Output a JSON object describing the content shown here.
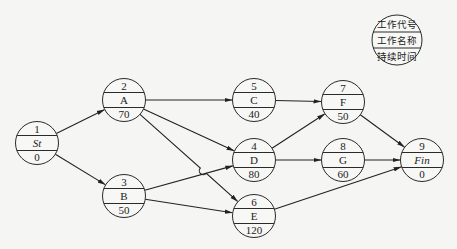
{
  "legend": {
    "rows": [
      "工作代号",
      "工作名称",
      "持续时间"
    ]
  },
  "nodes": [
    {
      "id": "1",
      "name": "St",
      "duration": "0",
      "italic": true
    },
    {
      "id": "2",
      "name": "A",
      "duration": "70"
    },
    {
      "id": "3",
      "name": "B",
      "duration": "50"
    },
    {
      "id": "4",
      "name": "D",
      "duration": "80"
    },
    {
      "id": "5",
      "name": "C",
      "duration": "40"
    },
    {
      "id": "6",
      "name": "E",
      "duration": "120"
    },
    {
      "id": "7",
      "name": "F",
      "duration": "50"
    },
    {
      "id": "8",
      "name": "G",
      "duration": "60"
    },
    {
      "id": "9",
      "name": "Fin",
      "duration": "0",
      "italic": true
    }
  ],
  "edges": [
    {
      "from": "1",
      "to": "2"
    },
    {
      "from": "1",
      "to": "3"
    },
    {
      "from": "2",
      "to": "5"
    },
    {
      "from": "2",
      "to": "4"
    },
    {
      "from": "2",
      "to": "6"
    },
    {
      "from": "3",
      "to": "4"
    },
    {
      "from": "3",
      "to": "6"
    },
    {
      "from": "5",
      "to": "7"
    },
    {
      "from": "4",
      "to": "7"
    },
    {
      "from": "4",
      "to": "8"
    },
    {
      "from": "6",
      "to": "9"
    },
    {
      "from": "7",
      "to": "9"
    },
    {
      "from": "8",
      "to": "9"
    }
  ]
}
